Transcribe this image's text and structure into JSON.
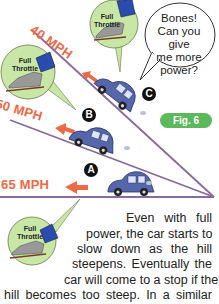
{
  "figure": {
    "label": "Fig. 6",
    "colors": {
      "speed_text": "#ee6a45",
      "car_body": "#5566aa",
      "slope_line": "#8a6a9a",
      "throttle_circle": "#c8e6a6",
      "fig_badge": "#5cb85c"
    },
    "speed_labels": {
      "top": "40 MPH",
      "middle": "50 MPH",
      "bottom": "65 MPH"
    },
    "markers": {
      "a": "A",
      "b": "B",
      "c": "C"
    },
    "throttle_insets": [
      {
        "label_line1": "Full",
        "label_line2": "Throttle"
      },
      {
        "label_line1": "Full",
        "label_line2": "Throttle"
      },
      {
        "label_line1": "Full",
        "label_line2": "Throttle"
      }
    ],
    "speech_bubble": {
      "line1": "Bones!",
      "line2": "Can you give",
      "line3": "me more",
      "line4": "power?"
    }
  },
  "body_text": {
    "lines": [
      "Even with full",
      "power, the car starts to",
      "slow down as the hill",
      "steepens. Eventually the",
      "car will come to a stop if the",
      "hill becomes too steep. In a similar"
    ]
  }
}
